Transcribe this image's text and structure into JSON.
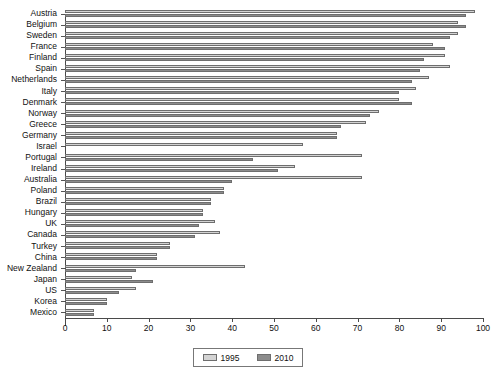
{
  "chart_data": {
    "type": "bar",
    "orientation": "horizontal",
    "title": "",
    "xlabel": "",
    "ylabel": "",
    "xlim": [
      0,
      100
    ],
    "xticks": [
      0,
      10,
      20,
      30,
      40,
      50,
      60,
      70,
      80,
      90,
      100
    ],
    "grid": false,
    "legend_position": "bottom-center",
    "categories": [
      "Austria",
      "Belgium",
      "Sweden",
      "France",
      "Finland",
      "Spain",
      "Netherlands",
      "Italy",
      "Denmark",
      "Norway",
      "Greece",
      "Germany",
      "Israel",
      "Portugal",
      "Ireland",
      "Australia",
      "Poland",
      "Brazil",
      "Hungary",
      "UK",
      "Canada",
      "Turkey",
      "China",
      "New Zealand",
      "Japan",
      "US",
      "Korea",
      "Mexico"
    ],
    "series": [
      {
        "name": "1995",
        "color": "#d3d3d3",
        "values": [
          98,
          94,
          94,
          88,
          91,
          92,
          87,
          84,
          80,
          75,
          72,
          65,
          57,
          71,
          55,
          71,
          38,
          35,
          33,
          36,
          37,
          25,
          22,
          43,
          16,
          17,
          10,
          7
        ]
      },
      {
        "name": "2010",
        "color": "#8c8c8c",
        "values": [
          96,
          96,
          92,
          91,
          86,
          85,
          83,
          80,
          83,
          73,
          66,
          65,
          0,
          45,
          51,
          40,
          38,
          35,
          33,
          32,
          31,
          25,
          22,
          17,
          21,
          13,
          10,
          7
        ]
      }
    ]
  },
  "legend": {
    "entries": [
      {
        "label": "1995"
      },
      {
        "label": "2010"
      }
    ]
  }
}
